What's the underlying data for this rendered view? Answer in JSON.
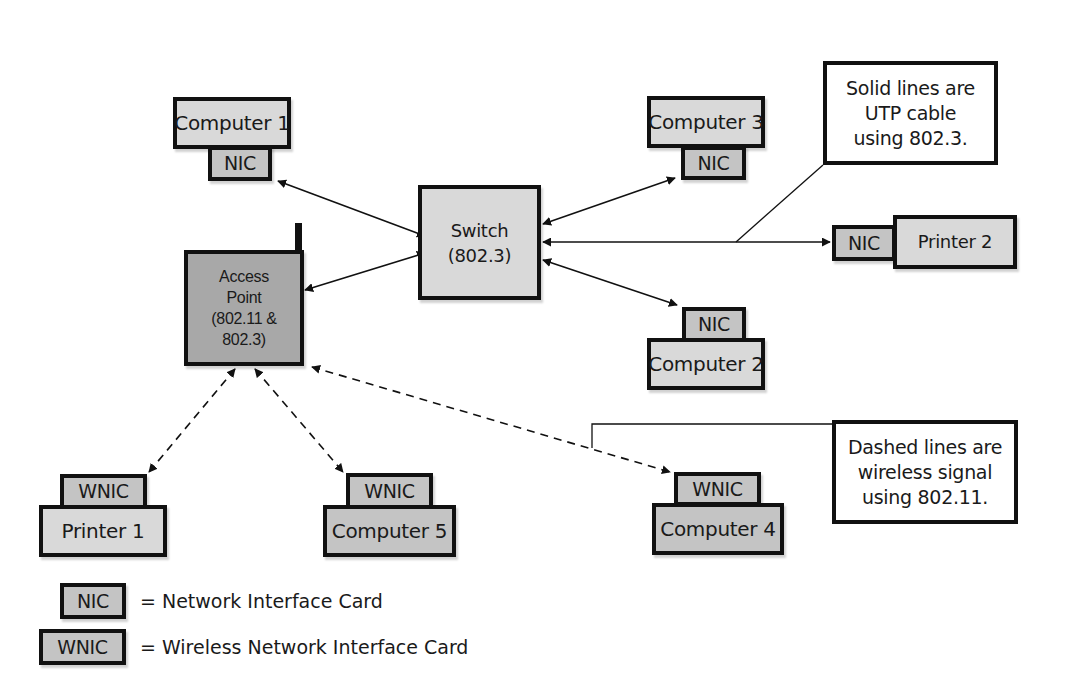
{
  "diagram": {
    "type": "network-topology",
    "nodes": {
      "switch": {
        "line1": "Switch",
        "line2": "(802.3)"
      },
      "access_point": {
        "line1": "Access",
        "line2": "Point",
        "line3": "(802.11 &",
        "line4": "802.3)"
      },
      "computer1": {
        "label": "Computer 1",
        "card": "NIC"
      },
      "computer2": {
        "label": "Computer 2",
        "card": "NIC"
      },
      "computer3": {
        "label": "Computer 3",
        "card": "NIC"
      },
      "computer4": {
        "label": "Computer 4",
        "card": "WNIC"
      },
      "computer5": {
        "label": "Computer 5",
        "card": "WNIC"
      },
      "printer1": {
        "label": "Printer 1",
        "card": "WNIC"
      },
      "printer2": {
        "label": "Printer 2",
        "card": "NIC"
      }
    },
    "edges": [
      {
        "from": "switch",
        "to": "computer1",
        "style": "solid"
      },
      {
        "from": "switch",
        "to": "computer3",
        "style": "solid"
      },
      {
        "from": "switch",
        "to": "printer2",
        "style": "solid"
      },
      {
        "from": "switch",
        "to": "computer2",
        "style": "solid"
      },
      {
        "from": "switch",
        "to": "access_point",
        "style": "solid"
      },
      {
        "from": "access_point",
        "to": "printer1",
        "style": "dashed"
      },
      {
        "from": "access_point",
        "to": "computer5",
        "style": "dashed"
      },
      {
        "from": "access_point",
        "to": "computer4",
        "style": "dashed"
      }
    ],
    "callouts": {
      "solid": {
        "line1": "Solid lines are",
        "line2": "UTP cable",
        "line3": "using 802.3."
      },
      "dashed": {
        "line1": "Dashed lines are",
        "line2": "wireless signal",
        "line3": "using 802.11."
      }
    },
    "legend": [
      {
        "key": "NIC",
        "text": "= Network Interface Card"
      },
      {
        "key": "WNIC",
        "text": "= Wireless Network Interface Card"
      }
    ]
  }
}
